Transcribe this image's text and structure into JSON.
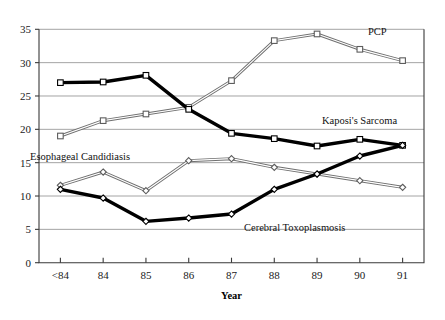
{
  "chart_data": {
    "type": "line",
    "title": "",
    "xlabel": "Year",
    "ylabel": "",
    "categories": [
      "<84",
      "84",
      "85",
      "86",
      "87",
      "88",
      "89",
      "90",
      "91"
    ],
    "ylim": [
      0,
      35
    ],
    "yticks": [
      0,
      5,
      10,
      15,
      20,
      25,
      30,
      35
    ],
    "grid": true,
    "legend_position": "inline-annotations",
    "series": [
      {
        "name": "PCP",
        "style": "hollow-square-light",
        "color": "#9a9a9a",
        "values": [
          19.0,
          21.3,
          22.3,
          23.3,
          27.3,
          33.3,
          34.3,
          32.0,
          30.3
        ]
      },
      {
        "name": "Kaposi's Sarcoma",
        "style": "bold-black-square",
        "color": "#000000",
        "values": [
          27.0,
          27.1,
          28.1,
          23.0,
          19.4,
          18.6,
          17.5,
          18.5,
          17.6
        ]
      },
      {
        "name": "Esophageal Candidiasis",
        "style": "hollow-diamond-light",
        "color": "#6d6d6d",
        "values": [
          11.6,
          13.6,
          10.8,
          15.3,
          15.6,
          14.3,
          13.3,
          12.3,
          11.3
        ]
      },
      {
        "name": "Cerebral Toxoplasmosis",
        "style": "bold-black-diamond",
        "color": "#000000",
        "values": [
          11.0,
          9.7,
          6.2,
          6.7,
          7.3,
          11.0,
          13.3,
          16.0,
          17.6
        ]
      }
    ],
    "annotations": [
      {
        "text": "PCP",
        "x": 368,
        "y": 35
      },
      {
        "text": "Kaposi's Sarcoma",
        "x": 322,
        "y": 124
      },
      {
        "text": "Esophageal Candidiasis",
        "x": 30,
        "y": 160
      },
      {
        "text": "Cerebral Toxoplasmosis",
        "x": 244,
        "y": 231
      }
    ]
  },
  "axes": {
    "x_title": "Year",
    "y_tick_labels": [
      "0",
      "5",
      "10",
      "15",
      "20",
      "25",
      "30",
      "35"
    ],
    "x_tick_labels": [
      "<84",
      "84",
      "85",
      "86",
      "87",
      "88",
      "89",
      "90",
      "91"
    ]
  }
}
